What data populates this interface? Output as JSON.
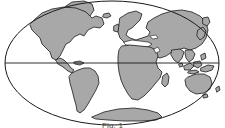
{
  "figure": {
    "caption": "Fig. 1",
    "background_color": "#ffffff"
  },
  "map": {
    "projection_name": "Mollweide elliptical world projection",
    "ocean_color": "#ffffff",
    "land_color": "#a8a8a8",
    "outline_color": "#1a1a1a",
    "graticule_color": "#1a1a1a",
    "outline_width": 1,
    "ellipse": {
      "center_x": 112,
      "center_y": 63,
      "radius_x": 107,
      "radius_y": 62
    },
    "graticule": {
      "equator_label": "Equator",
      "equator_y": 63,
      "lines_visible": 1
    },
    "landmasses": [
      {
        "name": "north-america"
      },
      {
        "name": "greenland"
      },
      {
        "name": "south-america"
      },
      {
        "name": "europe"
      },
      {
        "name": "africa"
      },
      {
        "name": "madagascar"
      },
      {
        "name": "asia"
      },
      {
        "name": "japan"
      },
      {
        "name": "indonesia"
      },
      {
        "name": "new-guinea"
      },
      {
        "name": "australia"
      },
      {
        "name": "new-zealand"
      },
      {
        "name": "antarctica"
      },
      {
        "name": "iceland"
      },
      {
        "name": "british-isles"
      },
      {
        "name": "sri-lanka"
      }
    ]
  }
}
